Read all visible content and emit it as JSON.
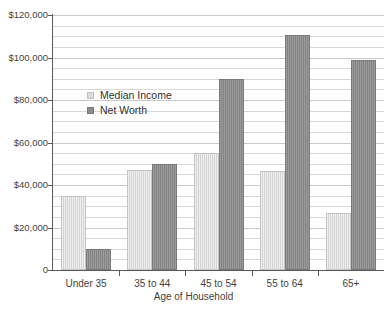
{
  "chart_data": {
    "type": "bar",
    "title": "",
    "xlabel": "Age of Household",
    "ylabel": "",
    "categories": [
      "Under 35",
      "35 to 44",
      "45 to 54",
      "55 to 64",
      "65+"
    ],
    "series": [
      {
        "name": "Median Income",
        "color": "#dcdcdc",
        "values": [
          35000,
          47000,
          55000,
          46500,
          27000
        ]
      },
      {
        "name": "Net Worth",
        "color": "#8d8d8d",
        "values": [
          10000,
          50000,
          90000,
          110500,
          99000
        ]
      }
    ],
    "ylim": [
      0,
      120000
    ],
    "y_major_step": 20000,
    "y_minor_step": 5000,
    "y_tick_labels": [
      "$120,000",
      "$100,000",
      "$80,000",
      "$60,000",
      "$40,000",
      "$20,000",
      "0"
    ],
    "y_tick_values": [
      120000,
      100000,
      80000,
      60000,
      40000,
      20000,
      0
    ],
    "grid": true,
    "grid_orientation": "horizontal",
    "legend_position": "inside-upper-left"
  },
  "axes": {
    "x_title": "Age of Household"
  },
  "legend": {
    "items": [
      {
        "label": "Median Income",
        "swatch": "median-income-swatch"
      },
      {
        "label": "Net Worth",
        "swatch": "net-worth-swatch"
      }
    ]
  },
  "footnote": {
    "text": ""
  }
}
